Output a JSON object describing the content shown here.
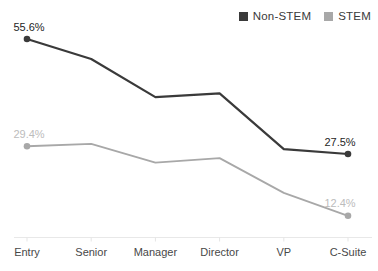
{
  "chart_data": {
    "type": "line",
    "title": "",
    "xlabel": "",
    "ylabel": "",
    "grid": false,
    "legend_position": "top-right",
    "categories": [
      "Entry",
      "Senior",
      "Manager",
      "Director",
      "VP",
      "C-Suite"
    ],
    "series": [
      {
        "name": "Non-STEM",
        "color": "#3a3a3a",
        "label_color": "#262626",
        "values": [
          55.6,
          50.7,
          41.4,
          42.3,
          28.7,
          27.5
        ],
        "endpoint_labels": {
          "first": "55.6%",
          "last": "27.5%"
        }
      },
      {
        "name": "STEM",
        "color": "#a8a8a8",
        "label_color": "#bcbcbc",
        "values": [
          29.4,
          30.0,
          25.4,
          26.5,
          18.0,
          12.4
        ],
        "endpoint_labels": {
          "first": "29.4%",
          "last": "12.4%"
        }
      }
    ],
    "axis": {
      "x_line_color": "#e8e8e8",
      "tick_color": "#e5e5e5",
      "category_label_color": "#484848"
    }
  }
}
